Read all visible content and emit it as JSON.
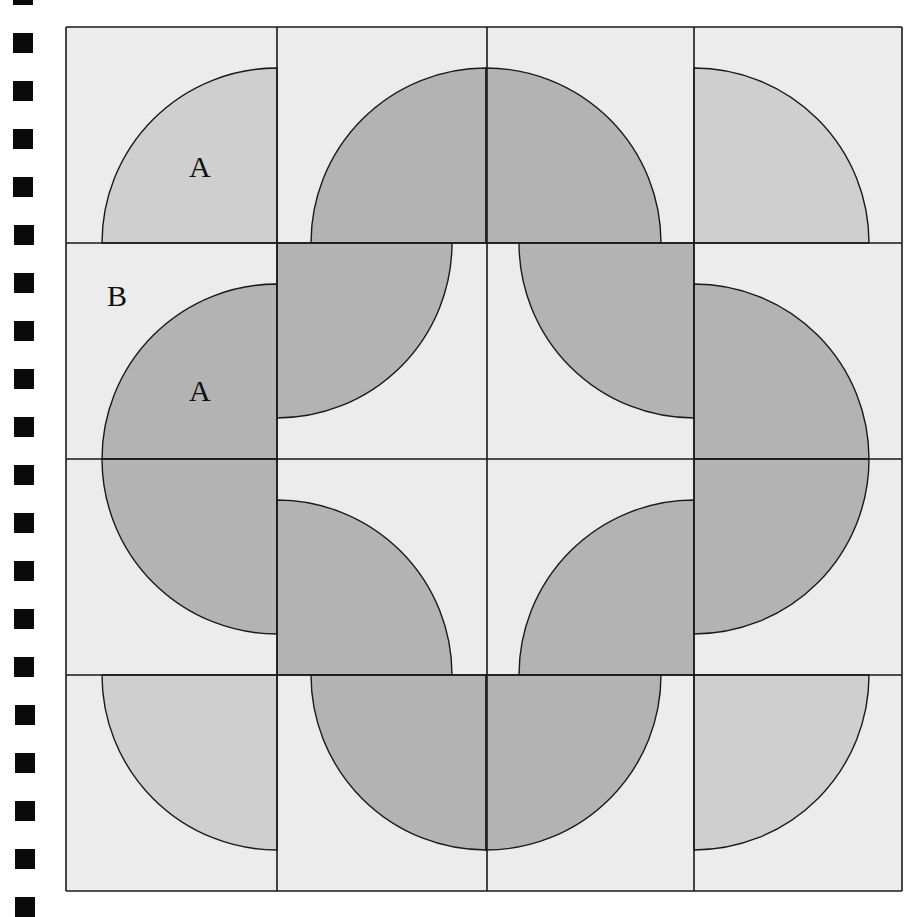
{
  "colors": {
    "background": "#ececec",
    "dark_fill": "#b3b3b3",
    "medium_fill": "#cfcfcf",
    "stroke": "#1a1a1a",
    "hole": "#0a0a0a"
  },
  "binding": {
    "hole_x": 13,
    "hole_size": 20,
    "first_y": -15,
    "spacing": 48,
    "count": 20
  },
  "grid": {
    "cols": [
      66,
      277,
      487,
      694,
      902
    ],
    "rows": [
      27,
      243,
      459,
      675,
      891
    ]
  },
  "radius": 175,
  "shapes": [
    {
      "name": "quarter-r1c1",
      "cx": 277,
      "cy": 243,
      "quadrant": "up-left",
      "fill": "medium"
    },
    {
      "name": "quarter-r1c2",
      "cx": 486,
      "cy": 243,
      "quadrant": "up-left",
      "fill": "dark"
    },
    {
      "name": "quarter-r1c3",
      "cx": 486,
      "cy": 243,
      "quadrant": "up-right",
      "fill": "dark"
    },
    {
      "name": "quarter-r1c4",
      "cx": 694,
      "cy": 243,
      "quadrant": "up-right",
      "fill": "medium"
    },
    {
      "name": "quarter-r2c1",
      "cx": 277,
      "cy": 459,
      "quadrant": "up-left",
      "fill": "dark"
    },
    {
      "name": "quarter-r2c2",
      "cx": 277,
      "cy": 243,
      "quadrant": "down-right",
      "fill": "dark"
    },
    {
      "name": "quarter-r2c3",
      "cx": 694,
      "cy": 243,
      "quadrant": "down-left",
      "fill": "dark"
    },
    {
      "name": "quarter-r2c4",
      "cx": 694,
      "cy": 459,
      "quadrant": "up-right",
      "fill": "dark"
    },
    {
      "name": "quarter-r3c1",
      "cx": 277,
      "cy": 459,
      "quadrant": "down-left",
      "fill": "dark"
    },
    {
      "name": "quarter-r3c2",
      "cx": 277,
      "cy": 675,
      "quadrant": "up-right",
      "fill": "dark"
    },
    {
      "name": "quarter-r3c3",
      "cx": 694,
      "cy": 675,
      "quadrant": "up-left",
      "fill": "dark"
    },
    {
      "name": "quarter-r3c4",
      "cx": 694,
      "cy": 459,
      "quadrant": "down-right",
      "fill": "dark"
    },
    {
      "name": "quarter-r4c1",
      "cx": 277,
      "cy": 675,
      "quadrant": "down-left",
      "fill": "medium"
    },
    {
      "name": "quarter-r4c2",
      "cx": 486,
      "cy": 675,
      "quadrant": "down-left",
      "fill": "dark"
    },
    {
      "name": "quarter-r4c3",
      "cx": 486,
      "cy": 675,
      "quadrant": "down-right",
      "fill": "dark"
    },
    {
      "name": "quarter-r4c4",
      "cx": 694,
      "cy": 675,
      "quadrant": "down-right",
      "fill": "medium"
    }
  ],
  "fills": [
    {
      "name": "fill-r2c2-band",
      "x": 277,
      "y": 243,
      "w": 0,
      "h": 0
    }
  ],
  "labels": [
    {
      "name": "label-a-top",
      "text": "A",
      "x": 189,
      "y": 177
    },
    {
      "name": "label-b",
      "text": "B",
      "x": 107,
      "y": 306
    },
    {
      "name": "label-a-middle",
      "text": "A",
      "x": 189,
      "y": 401
    }
  ]
}
